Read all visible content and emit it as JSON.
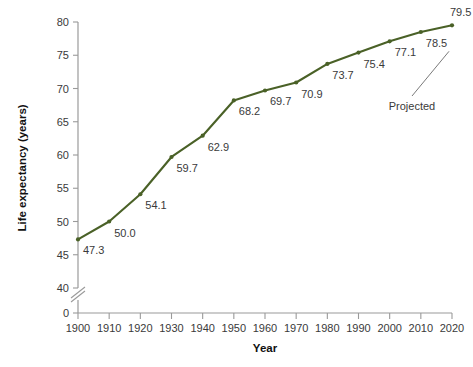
{
  "chart_data": {
    "type": "line",
    "title": "",
    "xlabel": "Year",
    "ylabel": "Life expectancy (years)",
    "x": [
      1900,
      1910,
      1920,
      1930,
      1940,
      1950,
      1960,
      1970,
      1980,
      1990,
      2000,
      2010,
      2020
    ],
    "values": [
      47.3,
      50.0,
      54.1,
      59.7,
      62.9,
      68.2,
      69.7,
      70.9,
      73.7,
      75.4,
      77.1,
      78.5,
      79.5
    ],
    "point_labels": [
      "47.3",
      "50.0",
      "54.1",
      "59.7",
      "62.9",
      "68.2",
      "69.7",
      "70.9",
      "73.7",
      "75.4",
      "77.1",
      "78.5",
      "79.5"
    ],
    "xticks": [
      "1900",
      "1910",
      "1920",
      "1930",
      "1940",
      "1950",
      "1960",
      "1970",
      "1980",
      "1990",
      "2000",
      "2010",
      "2020"
    ],
    "yticks": [
      "0",
      "40",
      "45",
      "50",
      "55",
      "60",
      "65",
      "70",
      "75",
      "80"
    ],
    "ylim": [
      40,
      80
    ],
    "xlim": [
      1900,
      2020
    ],
    "axis_break": true,
    "axis_break_symbol": "//",
    "grid": false,
    "legend": "none",
    "annotations": [
      {
        "text": "Projected",
        "points_to": 2020,
        "value": 79.5
      }
    ],
    "series_color": "#4a6127",
    "axis_color": "#9a9a9a",
    "text_color": "#3a3a3a",
    "background": "#ffffff"
  }
}
